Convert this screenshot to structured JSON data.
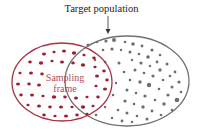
{
  "diagram": {
    "title": "Target population",
    "frame_label_line1": "Sampling",
    "frame_label_line2": "frame",
    "colors": {
      "population": "#707070",
      "frame": "#a83240",
      "frame_dots": "#a01e30",
      "population_dots": "#6e6e6e"
    }
  }
}
